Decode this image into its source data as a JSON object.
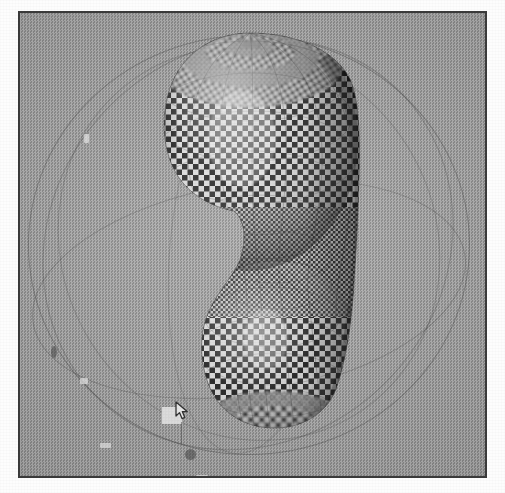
{
  "page": {
    "title": "3D Modeling Viewport",
    "background_color": "#fdfdfd",
    "width": 505,
    "height": 493
  },
  "viewport": {
    "name": "perspective-viewport",
    "background_color": "#9c9c9c",
    "border_color": "#3b3b3b",
    "description": "Shaded perspective view of a revolved surface with checkerboard texture map"
  },
  "model": {
    "name": "revolved-surface",
    "shape_description": "Surface of revolution resembling a rounded bottle or vase: a wide rounded-cube upper body, a narrow pinched waist, and a smaller rounded lower bulb",
    "texture": "checkerboard",
    "texture_colors": [
      "#f2f2f2",
      "#1a1a1a"
    ],
    "shading": "smooth-shaded with specular highlight",
    "wireframe_visible": true,
    "pole_at_top": true
  },
  "manipulator": {
    "name": "trackball-orbit-rings",
    "ring_count": 5,
    "ring_color": "#3c3c3c",
    "handles": [
      {
        "name": "orbit-handle-light-1",
        "x": 60,
        "y": 365,
        "w": 8,
        "h": 6
      },
      {
        "name": "orbit-handle-light-2",
        "x": 64,
        "y": 121,
        "w": 5,
        "h": 9
      },
      {
        "name": "orbit-handle-light-3",
        "x": 80,
        "y": 430,
        "w": 11,
        "h": 5
      },
      {
        "name": "orbit-handle-light-4",
        "x": 176,
        "y": 462,
        "w": 12,
        "h": 5
      },
      {
        "name": "orbit-handle-dark-1",
        "x": 31,
        "y": 333,
        "w": 6,
        "h": 12
      },
      {
        "name": "orbit-handle-dark-2",
        "x": 165,
        "y": 436,
        "w": 11,
        "h": 11
      }
    ]
  },
  "selection": {
    "name": "selection-handle",
    "color": "#efefef",
    "x": 142,
    "y": 394,
    "width": 20,
    "height": 17
  },
  "cursor": {
    "name": "arrow-cursor",
    "type": "arrow",
    "x": 155,
    "y": 388
  },
  "caption": "Checkerboard-mapped surface of revolution displayed in a 3D modeling viewport with trackball orbit manipulator"
}
